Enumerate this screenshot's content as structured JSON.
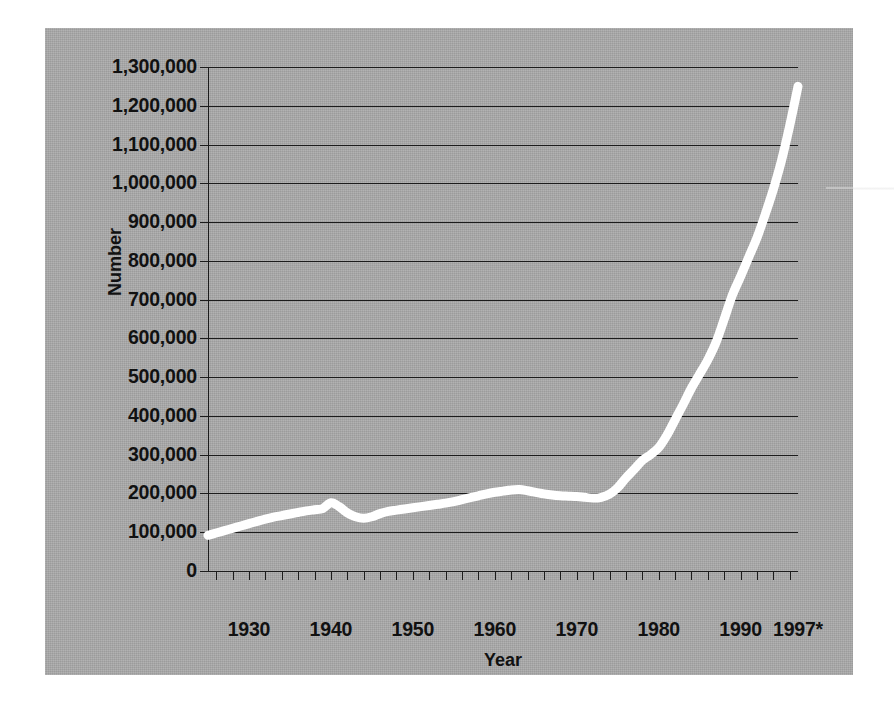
{
  "chart_data": {
    "type": "line",
    "title": "",
    "xlabel": "Year",
    "ylabel": "Number",
    "xlim": [
      1925,
      1997
    ],
    "ylim": [
      0,
      1300000
    ],
    "grid": true,
    "legend": null,
    "y_ticks": [
      {
        "value": 1300000,
        "label": "1,300,000"
      },
      {
        "value": 1200000,
        "label": "1,200,000"
      },
      {
        "value": 1100000,
        "label": "1,100,000"
      },
      {
        "value": 1000000,
        "label": "1,000,000"
      },
      {
        "value": 900000,
        "label": "900,000"
      },
      {
        "value": 800000,
        "label": "800,000"
      },
      {
        "value": 700000,
        "label": "700,000"
      },
      {
        "value": 600000,
        "label": "600,000"
      },
      {
        "value": 500000,
        "label": "500,000"
      },
      {
        "value": 400000,
        "label": "400,000"
      },
      {
        "value": 300000,
        "label": "300,000"
      },
      {
        "value": 200000,
        "label": "200,000"
      },
      {
        "value": 100000,
        "label": "100,000"
      },
      {
        "value": 0,
        "label": "0"
      }
    ],
    "x_ticks": [
      {
        "value": 1930,
        "label": "1930"
      },
      {
        "value": 1940,
        "label": "1940"
      },
      {
        "value": 1950,
        "label": "1950"
      },
      {
        "value": 1960,
        "label": "1960"
      },
      {
        "value": 1970,
        "label": "1970"
      },
      {
        "value": 1980,
        "label": "1980"
      },
      {
        "value": 1990,
        "label": "1990"
      },
      {
        "value": 1997,
        "label": "1997*"
      }
    ],
    "x_minor_tick_step": 2,
    "line_color": "#ffffff",
    "line_width": 9,
    "plot_background": "#a9a9a9",
    "axis_color": "#1c1c1c",
    "series": [
      {
        "name": "Number",
        "x": [
          1925,
          1926,
          1927,
          1928,
          1929,
          1930,
          1931,
          1932,
          1933,
          1934,
          1935,
          1936,
          1937,
          1938,
          1939,
          1940,
          1941,
          1942,
          1943,
          1944,
          1945,
          1946,
          1947,
          1948,
          1949,
          1950,
          1951,
          1952,
          1953,
          1954,
          1955,
          1956,
          1957,
          1958,
          1959,
          1960,
          1961,
          1962,
          1963,
          1964,
          1965,
          1966,
          1967,
          1968,
          1969,
          1970,
          1971,
          1972,
          1973,
          1974,
          1975,
          1976,
          1977,
          1978,
          1979,
          1980,
          1981,
          1982,
          1983,
          1984,
          1985,
          1986,
          1987,
          1988,
          1989,
          1990,
          1991,
          1992,
          1993,
          1994,
          1995,
          1996,
          1997
        ],
        "values": [
          92000,
          98000,
          104000,
          110000,
          116000,
          122000,
          128000,
          134000,
          139000,
          143000,
          147000,
          151000,
          155000,
          158000,
          161000,
          176000,
          166000,
          150000,
          140000,
          136000,
          140000,
          148000,
          154000,
          157000,
          160000,
          163000,
          166000,
          169000,
          172000,
          175000,
          179000,
          184000,
          189000,
          194000,
          199000,
          203000,
          206000,
          209000,
          210000,
          207000,
          203000,
          199000,
          196000,
          194000,
          193000,
          192000,
          190000,
          188000,
          190000,
          198000,
          215000,
          240000,
          262000,
          285000,
          300000,
          318000,
          350000,
          390000,
          430000,
          472000,
          508000,
          545000,
          590000,
          650000,
          712000,
          760000,
          810000,
          860000,
          920000,
          985000,
          1060000,
          1150000,
          1250000
        ]
      }
    ],
    "footnote_marker": "*"
  }
}
